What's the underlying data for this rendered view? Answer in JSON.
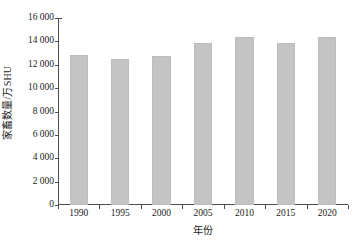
{
  "chart_data": {
    "type": "bar",
    "title": "",
    "xlabel": "年份",
    "ylabel": "家畜数量/万SHU",
    "categories": [
      "1990",
      "1995",
      "2000",
      "2005",
      "2010",
      "2015",
      "2020"
    ],
    "values": [
      12800,
      12500,
      12750,
      13850,
      14400,
      13850,
      14400
    ],
    "series": [
      {
        "name": "家畜数量",
        "values": [
          12800,
          12500,
          12750,
          13850,
          14400,
          13850,
          14400
        ]
      }
    ],
    "ylim": [
      0,
      16000
    ],
    "ytick_values": [
      0,
      2000,
      4000,
      6000,
      8000,
      10000,
      12000,
      14000,
      16000
    ],
    "ytick_labels": [
      "0",
      "2 000",
      "4 000",
      "6 000",
      "8 000",
      "10 000",
      "12 000",
      "14 000",
      "16 000"
    ],
    "xtick_labels": [
      "1990",
      "1995",
      "2000",
      "2005",
      "2010",
      "2015",
      "2020"
    ],
    "grid": false,
    "legend": false,
    "legend_position": "none",
    "bar_color": "#c4c4c4",
    "axis_color": "#4d4d4d",
    "text_color": "#1a1a1a",
    "annotations": []
  }
}
